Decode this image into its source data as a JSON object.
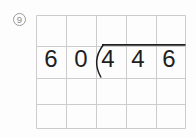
{
  "problem": {
    "number": "9",
    "divisor": "60",
    "dividend": "446",
    "divisor_digits": [
      "6",
      "0"
    ],
    "dividend_digits": [
      "4",
      "4",
      "6"
    ]
  },
  "colors": {
    "ink": "#1f1f1f",
    "grid_line": "#cccccc",
    "label": "#8c8c8c",
    "background": "#fdfdfd"
  },
  "icons": {
    "problem_badge": "circled-number-icon"
  }
}
